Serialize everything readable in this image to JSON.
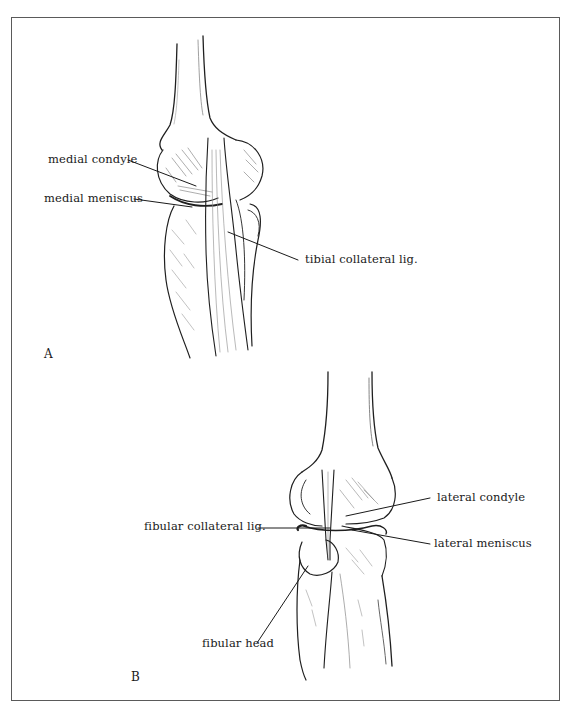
{
  "figure": {
    "frame_color": "#5a5a5a",
    "ink_color": "#1a1a1a",
    "panels": [
      {
        "id": "A",
        "letter": "A",
        "view": "medial view of knee",
        "labels": [
          {
            "key": "medial_condyle",
            "text": "medial condyle"
          },
          {
            "key": "medial_meniscus",
            "text": "medial meniscus"
          },
          {
            "key": "tibial_collateral_lig",
            "text": "tibial collateral lig."
          }
        ]
      },
      {
        "id": "B",
        "letter": "B",
        "view": "lateral view of knee",
        "labels": [
          {
            "key": "lateral_condyle",
            "text": "lateral condyle"
          },
          {
            "key": "fibular_collateral_lig",
            "text": "fibular collateral lig."
          },
          {
            "key": "lateral_meniscus",
            "text": "lateral meniscus"
          },
          {
            "key": "fibular_head",
            "text": "fibular head"
          }
        ]
      }
    ]
  }
}
